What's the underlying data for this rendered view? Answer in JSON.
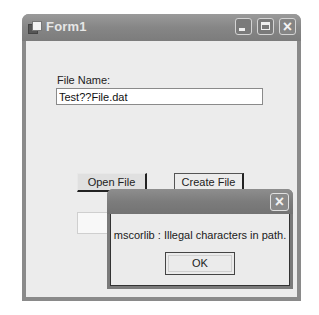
{
  "window": {
    "title": "Form1",
    "icon": "app-window-icon",
    "controls": {
      "minimize": "minimize-icon",
      "maximize": "maximize-icon",
      "close": "×"
    }
  },
  "form": {
    "file_name_label": "File Name:",
    "file_name_value": "Test??File.dat",
    "open_button": "Open File",
    "create_button": "Create File",
    "third_button": ""
  },
  "message_box": {
    "close": "×",
    "message": "mscorlib : Illegal characters in path.",
    "ok_button": "OK"
  }
}
